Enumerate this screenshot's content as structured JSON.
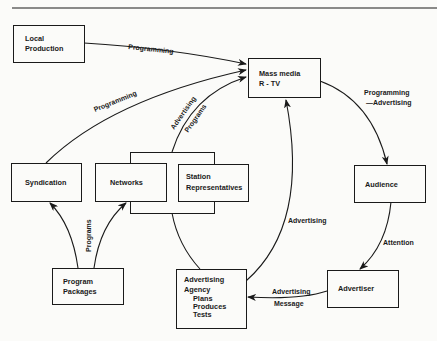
{
  "diagram": {
    "nodes": {
      "local_production": {
        "line1": "Local",
        "line2": "Production"
      },
      "mass_media": {
        "line1": "Mass media",
        "line2": "R - TV"
      },
      "syndication": {
        "label": "Syndication"
      },
      "networks": {
        "label": "Networks"
      },
      "station_reps": {
        "line1": "Station",
        "line2": "Representatives"
      },
      "audience": {
        "label": "Audience"
      },
      "program_packages": {
        "line1": "Program",
        "line2": "Packages"
      },
      "ad_agency": {
        "line1": "Advertising",
        "line2": "Agency",
        "line3": "Plans",
        "line4": "Produces",
        "line5": "Tests"
      },
      "advertiser": {
        "label": "Advertiser"
      }
    },
    "edges": {
      "local_to_media": "Programming",
      "syndication_to_media": "Programming",
      "group_to_media_a": "Advertising",
      "group_to_media_b": "Programs",
      "media_to_audience_a": "Programming",
      "media_to_audience_b": "—Advertising",
      "audience_to_advertiser": "Attention",
      "advertiser_to_agency_a": "Advertising",
      "advertiser_to_agency_b": "Message",
      "agency_to_media": "Advertising",
      "packages_to_syn_net": "Programs"
    },
    "colors": {
      "ink": "#1a1a1a",
      "paper": "#fbfbf9"
    }
  }
}
